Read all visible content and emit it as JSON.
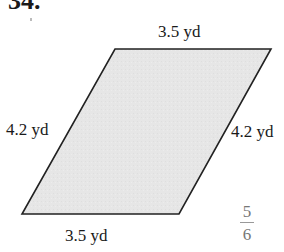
{
  "problem": {
    "number": "34."
  },
  "figure": {
    "shape": "parallelogram",
    "fill_color": "#e6e6e6",
    "stroke_color": "#222222",
    "vertices": [
      [
        115,
        49
      ],
      [
        271,
        49
      ],
      [
        179,
        214
      ],
      [
        22,
        214
      ]
    ],
    "labels": {
      "top": "3.5 yd",
      "left": "4.2 yd",
      "right": "4.2 yd",
      "bottom": "3.5 yd"
    }
  },
  "page_marker": {
    "numerator": "5",
    "denominator": "6"
  }
}
